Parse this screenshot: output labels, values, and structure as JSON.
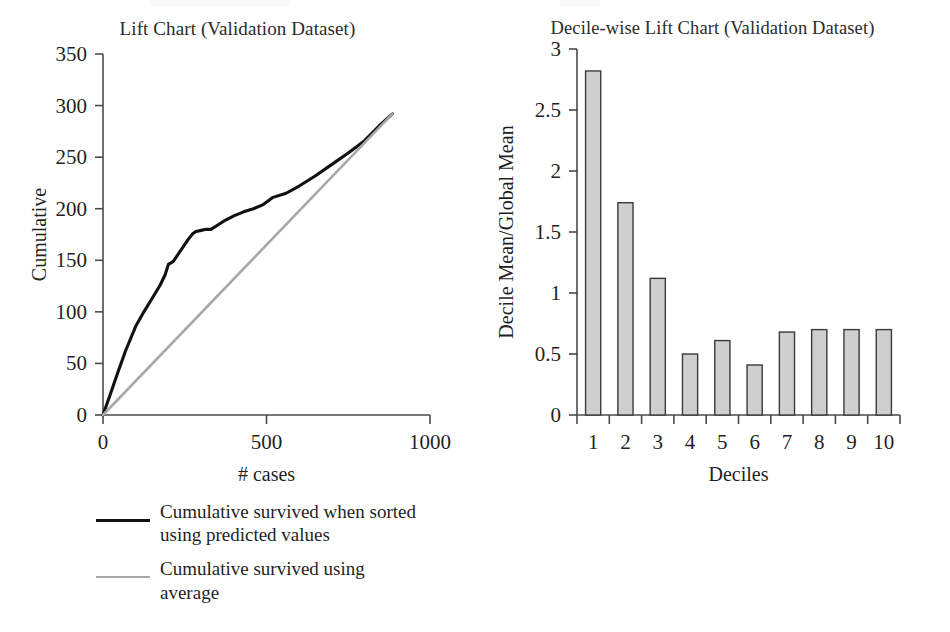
{
  "figure": {
    "background": "#ffffff",
    "line_color_predicted": "#111111",
    "line_color_average": "#a8a8a8",
    "bar_fill": "#cfcfcf",
    "bar_stroke": "#3a3a3a"
  },
  "left_panel": {
    "title": "Lift Chart (Validation Dataset)",
    "xlabel": "# cases",
    "ylabel": "Cumulative",
    "xticks": [
      "0",
      "500",
      "1000"
    ],
    "yticks": [
      "0",
      "50",
      "100",
      "150",
      "200",
      "250",
      "300",
      "350"
    ],
    "legend": [
      {
        "swatch": "dark",
        "label": "Cumulative survived when sorted using predicted values"
      },
      {
        "swatch": "grey",
        "label": "Cumulative survived using average"
      }
    ]
  },
  "right_panel": {
    "title": "Decile-wise Lift Chart (Validation Dataset)",
    "xlabel": "Deciles",
    "ylabel": "Decile Mean/Global Mean",
    "xticks": [
      "1",
      "2",
      "3",
      "4",
      "5",
      "6",
      "7",
      "8",
      "9",
      "10"
    ],
    "yticks": [
      "0",
      "0.5",
      "1",
      "1.5",
      "2",
      "2.5",
      "3"
    ]
  },
  "chart_data": [
    {
      "type": "line",
      "title": "Lift Chart (Validation Dataset)",
      "xlabel": "# cases",
      "ylabel": "Cumulative",
      "xlim": [
        0,
        1000
      ],
      "ylim": [
        0,
        350
      ],
      "xticks": [
        0,
        500,
        1000
      ],
      "yticks": [
        0,
        50,
        100,
        150,
        200,
        250,
        300,
        350
      ],
      "grid": false,
      "legend_position": "below-left",
      "series": [
        {
          "name": "Cumulative survived when sorted using predicted values",
          "color": "#111111",
          "x": [
            0,
            20,
            45,
            70,
            100,
            125,
            150,
            175,
            190,
            200,
            215,
            230,
            245,
            260,
            275,
            285,
            300,
            315,
            330,
            350,
            375,
            400,
            430,
            460,
            490,
            520,
            560,
            600,
            650,
            700,
            750,
            800,
            850,
            885
          ],
          "y": [
            0,
            18,
            41,
            63,
            86,
            100,
            113,
            126,
            136,
            146,
            149,
            156,
            163,
            170,
            176,
            178,
            179,
            180,
            180,
            184,
            189,
            193,
            197,
            200,
            204,
            211,
            215,
            222,
            232,
            243,
            254,
            266,
            282,
            292
          ]
        },
        {
          "name": "Cumulative survived using average",
          "color": "#a8a8a8",
          "x": [
            0,
            885
          ],
          "y": [
            0,
            292
          ]
        }
      ]
    },
    {
      "type": "bar",
      "title": "Decile-wise Lift Chart (Validation Dataset)",
      "xlabel": "Deciles",
      "ylabel": "Decile Mean/Global Mean",
      "categories": [
        "1",
        "2",
        "3",
        "4",
        "5",
        "6",
        "7",
        "8",
        "9",
        "10"
      ],
      "values": [
        2.82,
        1.74,
        1.12,
        0.5,
        0.61,
        0.41,
        0.68,
        0.7,
        0.7,
        0.7
      ],
      "ylim": [
        0,
        3
      ],
      "yticks": [
        0,
        0.5,
        1,
        1.5,
        2,
        2.5,
        3
      ],
      "grid": false
    }
  ]
}
